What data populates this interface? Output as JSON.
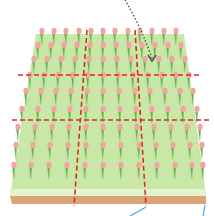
{
  "figure": {
    "caption_top_left": "",
    "colors": {
      "ground_top": "#c9e8a8",
      "ground_edge": "#e4f3cf",
      "soil": "#d9a576",
      "leaf": "#5fa24a",
      "leaf_light": "#9fd07e",
      "flower": "#f2a3a3",
      "grid_line": "#e02a1c",
      "arrow": "#555555",
      "pointer": "#4aa6e0"
    },
    "grid": {
      "rows": 3,
      "cols": 3
    },
    "annotations": [
      {
        "type": "dotted-arrow",
        "from": "top-center",
        "to": "top-right cell"
      },
      {
        "type": "pointer-line",
        "position": "bottom-center-right"
      },
      {
        "type": "pointer-line",
        "position": "bottom-right"
      }
    ]
  }
}
